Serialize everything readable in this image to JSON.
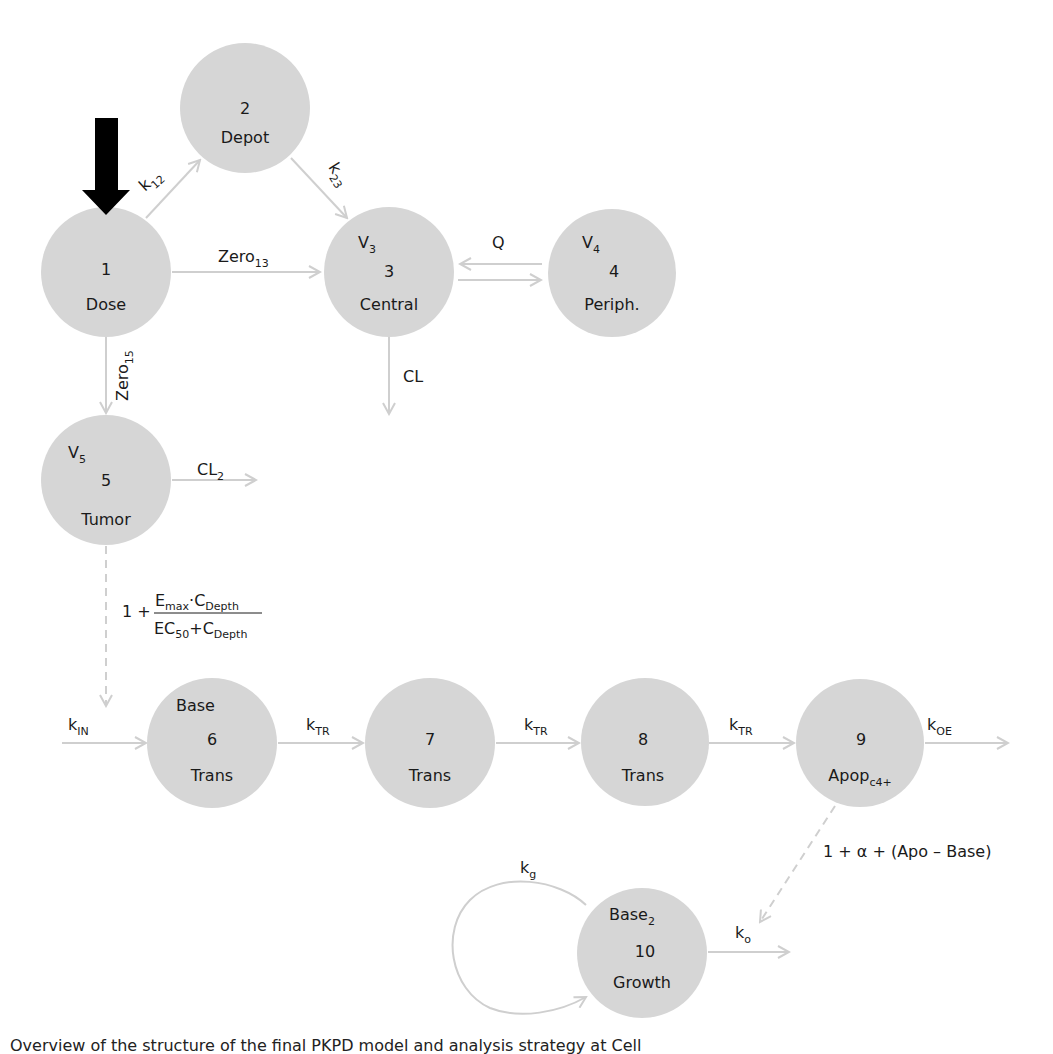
{
  "diagram": {
    "colors": {
      "node_fill": "#d6d6d6",
      "edge": "#cfcfcf",
      "dose_arrow": "#000000",
      "text": "#1a1a1a"
    },
    "nodes": [
      {
        "id": 1,
        "number": "1",
        "name": "Dose",
        "volume": ""
      },
      {
        "id": 2,
        "number": "2",
        "name": "Depot",
        "volume": ""
      },
      {
        "id": 3,
        "number": "3",
        "name": "Central",
        "volume": "V",
        "volume_sub": "3"
      },
      {
        "id": 4,
        "number": "4",
        "name": "Periph.",
        "volume": "V",
        "volume_sub": "4"
      },
      {
        "id": 5,
        "number": "5",
        "name": "Tumor",
        "volume": "V",
        "volume_sub": "5"
      },
      {
        "id": 6,
        "number": "6",
        "name": "Trans",
        "top_label": "Base"
      },
      {
        "id": 7,
        "number": "7",
        "name": "Trans"
      },
      {
        "id": 8,
        "number": "8",
        "name": "Trans"
      },
      {
        "id": 9,
        "number": "9",
        "name": "Apop",
        "name_sub": "c4+"
      },
      {
        "id": 10,
        "number": "10",
        "name": "Growth",
        "top_label": "Base",
        "top_label_sub": "2"
      }
    ],
    "edges": [
      {
        "from": 1,
        "to": 2,
        "label": "k",
        "label_sub": "12"
      },
      {
        "from": 2,
        "to": 3,
        "label": "k",
        "label_sub": "23"
      },
      {
        "from": 1,
        "to": 3,
        "label": "Zero",
        "label_sub": "13"
      },
      {
        "from": 3,
        "to": 4,
        "label": "Q",
        "bidirectional": true
      },
      {
        "from": 3,
        "to": "out",
        "label": "CL",
        "label_sub": ""
      },
      {
        "from": 1,
        "to": 5,
        "label": "Zero",
        "label_sub": "15"
      },
      {
        "from": 5,
        "to": "out",
        "label": "CL",
        "label_sub": "2"
      },
      {
        "from": "in",
        "to": 6,
        "label": "k",
        "label_sub": "IN"
      },
      {
        "from": 6,
        "to": 7,
        "label": "k",
        "label_sub": "TR"
      },
      {
        "from": 7,
        "to": 8,
        "label": "k",
        "label_sub": "TR"
      },
      {
        "from": 8,
        "to": 9,
        "label": "k",
        "label_sub": "TR"
      },
      {
        "from": 9,
        "to": "out",
        "label": "k",
        "label_sub": "OE"
      },
      {
        "from": 10,
        "to": 10,
        "label": "k",
        "label_sub": "g",
        "self_loop": true
      },
      {
        "from": 10,
        "to": "out",
        "label": "k",
        "label_sub": "o"
      }
    ],
    "effects": [
      {
        "from": 5,
        "to": "edge k_IN",
        "style": "dashed",
        "formula": {
          "prefix": "1 +",
          "numerator": "E_max · C_Depth",
          "denominator": "EC_50 + C_Depth",
          "num_a": "E",
          "num_a_sub": "max",
          "num_dot": "·",
          "num_b": "C",
          "num_b_sub": "Depth",
          "den_a": "EC",
          "den_a_sub": "50",
          "den_plus": "+",
          "den_b": "C",
          "den_b_sub": "Depth"
        }
      },
      {
        "from": 9,
        "to": "edge k_o",
        "style": "dashed",
        "formula": {
          "text": "1 + α + (Apo – Base)"
        }
      }
    ],
    "dose_input": {
      "label": "dose-arrow",
      "target": 1
    }
  },
  "caption": {
    "text": "Overview of the structure of the final PKPD model and analysis strategy at Cell"
  }
}
